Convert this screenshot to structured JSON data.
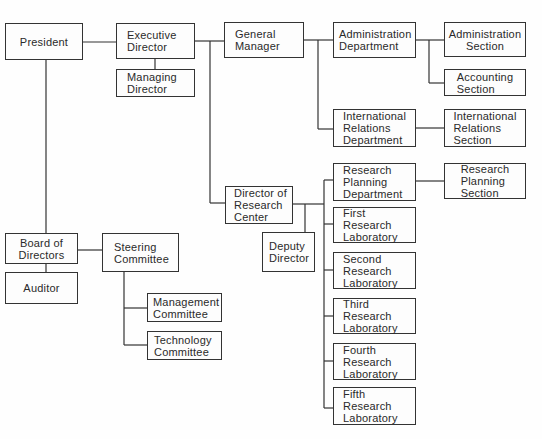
{
  "diagram": {
    "type": "org-chart",
    "nodes": {
      "president": "President",
      "executive_director": "Executive\nDirector",
      "managing_director": "Managing\nDirector",
      "general_manager": "General\nManager",
      "administration_department": "Administration\nDepartment",
      "administration_section": "Administration\nSection",
      "accounting_section": "Accounting\nSection",
      "international_relations_department": "International\nRelations\nDepartment",
      "international_relations_section": "International\nRelations\nSection",
      "research_planning_department": "Research\nPlanning\nDepartment",
      "research_planning_section": "Research\nPlanning\nSection",
      "director_of_research_center": "Director of\nResearch\nCenter",
      "deputy_director": "Deputy\nDirector",
      "first_research_laboratory": "First\nResearch\nLaboratory",
      "second_research_laboratory": "Second\nResearch\nLaboratory",
      "third_research_laboratory": "Third\nResearch\nLaboratory",
      "fourth_research_laboratory": "Fourth\nResearch\nLaboratory",
      "fifth_research_laboratory": "Fifth\nResearch\nLaboratory",
      "board_of_directors": "Board of\nDirectors",
      "auditor": "Auditor",
      "steering_committee": "Steering\nCommittee",
      "management_committee": "Management\nCommittee",
      "technology_committee": "Technology\nCommittee"
    },
    "edges": [
      [
        "president",
        "executive_director"
      ],
      [
        "executive_director",
        "managing_director"
      ],
      [
        "executive_director",
        "general_manager"
      ],
      [
        "executive_director",
        "director_of_research_center"
      ],
      [
        "general_manager",
        "administration_department"
      ],
      [
        "general_manager",
        "international_relations_department"
      ],
      [
        "administration_department",
        "administration_section"
      ],
      [
        "administration_department",
        "accounting_section"
      ],
      [
        "international_relations_department",
        "international_relations_section"
      ],
      [
        "director_of_research_center",
        "deputy_director"
      ],
      [
        "director_of_research_center",
        "research_planning_department"
      ],
      [
        "director_of_research_center",
        "first_research_laboratory"
      ],
      [
        "director_of_research_center",
        "second_research_laboratory"
      ],
      [
        "director_of_research_center",
        "third_research_laboratory"
      ],
      [
        "director_of_research_center",
        "fourth_research_laboratory"
      ],
      [
        "director_of_research_center",
        "fifth_research_laboratory"
      ],
      [
        "research_planning_department",
        "research_planning_section"
      ],
      [
        "president",
        "board_of_directors"
      ],
      [
        "board_of_directors",
        "auditor"
      ],
      [
        "board_of_directors",
        "steering_committee"
      ],
      [
        "steering_committee",
        "management_committee"
      ],
      [
        "steering_committee",
        "technology_committee"
      ]
    ]
  }
}
